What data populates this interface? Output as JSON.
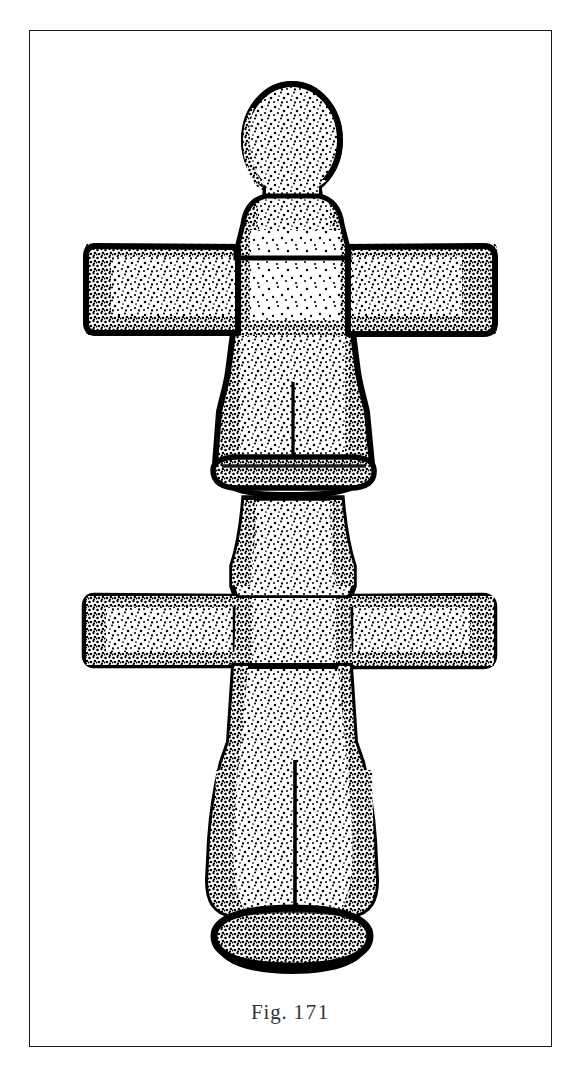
{
  "page": {
    "background_color": "#ffffff",
    "width": 585,
    "height": 1073
  },
  "plate": {
    "frame_color": "#1a1a1a",
    "frame_border_width": 1.6,
    "inner_background": "#ffffff"
  },
  "caption": {
    "prefix": "Fig.",
    "number": "171",
    "full_text": "Fig. 171",
    "color": "#333333"
  },
  "illustration": {
    "title": "Fig. 171",
    "technique": "stippled pen-and-ink archaeological line drawing",
    "subject": "double-armed anthropomorphic idol figurine",
    "ink_color": "#000000",
    "fill_color": "#ffffff",
    "parts": [
      {
        "name": "head",
        "description": "rounded dome-shaped head, stippled"
      },
      {
        "name": "neck",
        "description": "short tapering neck below head"
      },
      {
        "name": "upper-shoulders",
        "description": "flared shoulders above upper arm bar"
      },
      {
        "name": "upper-left-arm",
        "description": "horizontal bar arm extending left, blunt squared end"
      },
      {
        "name": "upper-right-arm",
        "description": "horizontal bar arm extending right, blunt squared end"
      },
      {
        "name": "upper-torso",
        "description": "trapezoidal torso narrowing to waist"
      },
      {
        "name": "upper-incised-line",
        "description": "short vertical incised groove on upper torso"
      },
      {
        "name": "waist-band",
        "description": "horizontal collar / girdle band across the waist"
      },
      {
        "name": "mid-body",
        "description": "waisted hourglass section below girdle"
      },
      {
        "name": "lower-left-arm",
        "description": "second horizontal bar arm extending left"
      },
      {
        "name": "lower-right-arm",
        "description": "second horizontal bar arm extending right"
      },
      {
        "name": "lower-torso",
        "description": "lower body / legs block, slightly flared"
      },
      {
        "name": "lower-incised-line",
        "description": "long vertical incised groove dividing the legs"
      },
      {
        "name": "base",
        "description": "flat oval pedestal foot, heavily inked"
      }
    ]
  }
}
